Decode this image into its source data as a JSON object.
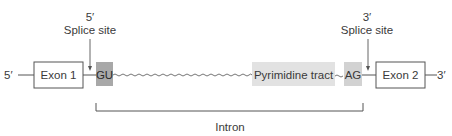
{
  "diagram": {
    "left_end_label": "5′",
    "right_end_label": "3′",
    "exon1": {
      "label": "Exon 1"
    },
    "exon2": {
      "label": "Exon 2"
    },
    "donor": {
      "label": "GU",
      "color": "#a8a8a8"
    },
    "pyrimidine": {
      "label": "Pyrimidine tract",
      "color": "#e2e2e2"
    },
    "acceptor": {
      "label": "AG",
      "color": "#d2d2d2"
    },
    "splice5": {
      "line1": "5′",
      "line2": "Splice site"
    },
    "splice3": {
      "line1": "3′",
      "line2": "Splice site"
    },
    "intron": {
      "label": "Intron"
    }
  }
}
